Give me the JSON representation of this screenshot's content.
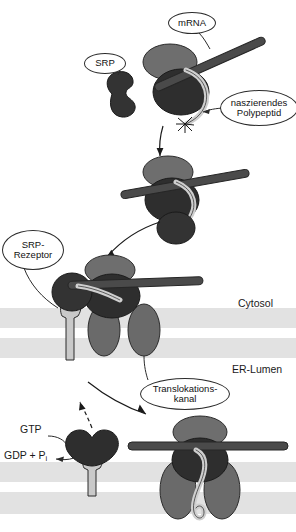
{
  "diagram": {
    "language": "de"
  },
  "labels": {
    "mrna": "mRNA",
    "srp": "SRP",
    "nascent_line1": "naszierendes",
    "nascent_line2": "Polypeptid",
    "srp_receptor_line1": "SRP-",
    "srp_receptor_line2": "Rezeptor",
    "translocon_line1": "Translokations-",
    "translocon_line2": "kanal",
    "cytosol": "Cytosol",
    "er_lumen": "ER-Lumen",
    "gtp": "GTP",
    "gdp_pi_prefix": "GDP + P",
    "gdp_pi_sub": "i"
  },
  "colors": {
    "large_subunit": "#2e2e2e",
    "small_subunit": "#6e6e6e",
    "mrna_rod": "#4a4a4a",
    "srp_body": "#333333",
    "translocon": "#6a6a6a",
    "receptor_stalk": "#c9c9c9",
    "polypeptide": "#cfcfcf",
    "membrane_band": "#e2e2e2",
    "outline": "#2b2b2b",
    "text": "#1a1a1a",
    "background": "#ffffff"
  },
  "stages": [
    {
      "id": "stage-1",
      "name": "Translation im Cytosol, SRP bindet naszierendes Polypeptid"
    },
    {
      "id": "stage-2",
      "name": "SRP-Ribosom-Komplex"
    },
    {
      "id": "stage-3",
      "name": "Bindung an SRP-Rezeptor an der ER-Membran"
    },
    {
      "id": "stage-4",
      "name": "Translokation, GTP-Hydrolyse und SRP-Freisetzung"
    }
  ],
  "membranes": [
    {
      "id": "membrane-upper",
      "y": 308,
      "height": 20
    },
    {
      "id": "membrane-lower",
      "y": 338,
      "height": 20
    },
    {
      "id": "membrane-bottom-upper",
      "y": 462,
      "height": 20
    },
    {
      "id": "membrane-bottom-lower",
      "y": 492,
      "height": 20
    }
  ]
}
